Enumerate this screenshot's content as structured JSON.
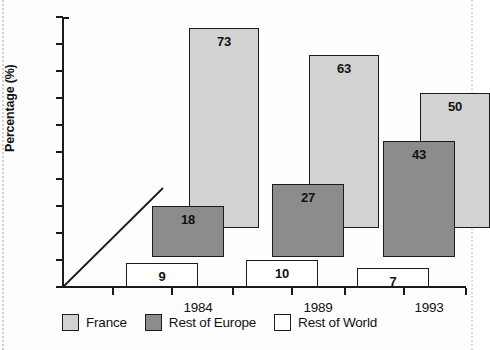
{
  "chart_data": {
    "type": "bar",
    "title": "",
    "subtitle": "",
    "xlabel": "",
    "ylabel": "Percentage (%)",
    "ylim": [
      0,
      100
    ],
    "ytick_step": 10,
    "yticks": [
      100,
      90,
      80,
      70,
      60,
      50,
      40,
      30,
      20,
      10,
      0
    ],
    "categories": [
      "1984",
      "1989",
      "1993"
    ],
    "grid": false,
    "legend_position": "bottom",
    "series": [
      {
        "name": "France",
        "color": "#d2d2d2",
        "values": [
          73,
          63,
          50
        ],
        "value_labels": [
          "73",
          "63",
          "50"
        ],
        "bar_tops": [
          96,
          86,
          72
        ],
        "bar_bottoms": [
          22,
          22,
          22
        ]
      },
      {
        "name": "Rest of Europe",
        "color": "#8c8c8c",
        "values": [
          18,
          27,
          43
        ],
        "value_labels": [
          "18",
          "27",
          "43"
        ],
        "bar_tops": [
          30,
          38,
          54
        ],
        "bar_bottoms": [
          11,
          11,
          11
        ]
      },
      {
        "name": "Rest of World",
        "color": "#ffffff",
        "values": [
          9,
          10,
          7
        ],
        "value_labels": [
          "9",
          "10",
          "7"
        ],
        "bar_tops": [
          9,
          10,
          7
        ],
        "bar_bottoms": [
          0,
          0,
          0
        ]
      }
    ],
    "annotations": [
      {
        "name": "origin-diagonal-line",
        "type": "line",
        "from": [
          0,
          0
        ],
        "to": [
          1984,
          40
        ]
      }
    ]
  },
  "legend": {
    "items": [
      {
        "label": "France",
        "swatch": "france"
      },
      {
        "label": "Rest of Europe",
        "swatch": "europe"
      },
      {
        "label": "Rest of World",
        "swatch": "world"
      }
    ]
  },
  "axis": {
    "y": {
      "label": "Percentage (%)",
      "ticks": [
        "100",
        "90",
        "80",
        "70",
        "60",
        "50",
        "40",
        "30",
        "20",
        "10",
        "0"
      ]
    },
    "x": {
      "ticks": [
        "1984",
        "1989",
        "1993"
      ]
    }
  }
}
